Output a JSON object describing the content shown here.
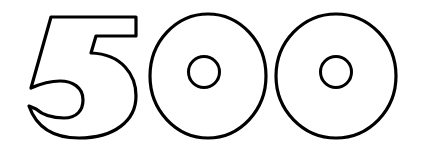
{
  "graphic": {
    "text": "500",
    "digits": [
      "5",
      "0",
      "0"
    ],
    "style": "outline",
    "stroke_color": "#000000",
    "fill_color": "#ffffff",
    "background_color": "#ffffff"
  }
}
